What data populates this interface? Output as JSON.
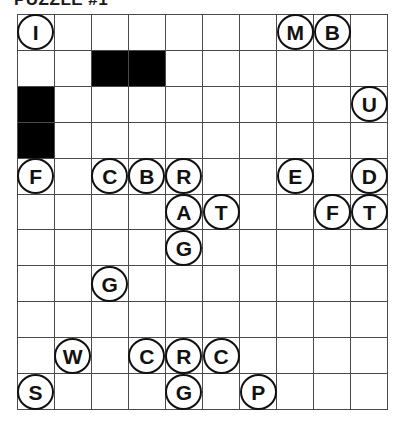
{
  "title": "PUZZLE #1",
  "grid": {
    "columns": 10,
    "rows": 11,
    "cell_size_px": 37,
    "origin_x_px": 17,
    "origin_y_px": 14,
    "line_color": "#4a4a4a",
    "blocked_color": "#000000",
    "background_color": "#ffffff",
    "token_color": "#ffffff",
    "token_border_color": "#111111"
  },
  "blocked_cells": [
    {
      "row": 2,
      "col": 3
    },
    {
      "row": 2,
      "col": 4
    },
    {
      "row": 3,
      "col": 1
    },
    {
      "row": 4,
      "col": 1
    }
  ],
  "tokens": [
    {
      "row": 1,
      "col": 1,
      "letter": "I"
    },
    {
      "row": 1,
      "col": 8,
      "letter": "M"
    },
    {
      "row": 1,
      "col": 9,
      "letter": "B"
    },
    {
      "row": 3,
      "col": 10,
      "letter": "U"
    },
    {
      "row": 5,
      "col": 1,
      "letter": "F"
    },
    {
      "row": 5,
      "col": 3,
      "letter": "C"
    },
    {
      "row": 5,
      "col": 4,
      "letter": "B"
    },
    {
      "row": 5,
      "col": 5,
      "letter": "R"
    },
    {
      "row": 5,
      "col": 8,
      "letter": "E"
    },
    {
      "row": 5,
      "col": 10,
      "letter": "D"
    },
    {
      "row": 6,
      "col": 5,
      "letter": "A"
    },
    {
      "row": 6,
      "col": 6,
      "letter": "T"
    },
    {
      "row": 6,
      "col": 9,
      "letter": "F"
    },
    {
      "row": 6,
      "col": 10,
      "letter": "T"
    },
    {
      "row": 7,
      "col": 5,
      "letter": "G"
    },
    {
      "row": 8,
      "col": 3,
      "letter": "G"
    },
    {
      "row": 10,
      "col": 2,
      "letter": "W"
    },
    {
      "row": 10,
      "col": 4,
      "letter": "C"
    },
    {
      "row": 10,
      "col": 5,
      "letter": "R"
    },
    {
      "row": 10,
      "col": 6,
      "letter": "C"
    },
    {
      "row": 11,
      "col": 1,
      "letter": "S"
    },
    {
      "row": 11,
      "col": 5,
      "letter": "G"
    },
    {
      "row": 11,
      "col": 7,
      "letter": "P"
    }
  ]
}
